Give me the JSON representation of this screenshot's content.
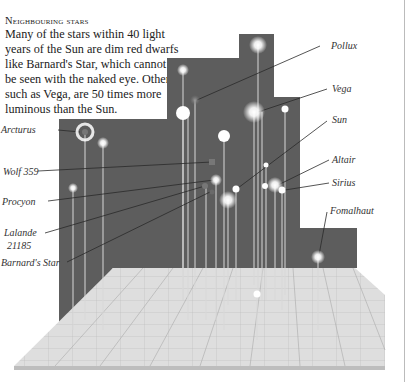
{
  "intro": {
    "title": "Neighbouring stars",
    "lines": [
      "Many of the stars within 40 light",
      "years of the Sun are dim red dwarfs",
      "like Barnard's Star, which cannot",
      "be seen with the naked eye. Others,",
      "such as Vega, are 50 times more",
      "luminous than the Sun."
    ]
  },
  "labels": {
    "left": [
      {
        "id": "arcturus",
        "text": "Arcturus"
      },
      {
        "id": "wolf359",
        "text": "Wolf 359"
      },
      {
        "id": "procyon",
        "text": "Procyon"
      },
      {
        "id": "lalande1",
        "text": "Lalande"
      },
      {
        "id": "lalande2",
        "text": "21185"
      },
      {
        "id": "barnard",
        "text": "Barnard's Star"
      }
    ],
    "right": [
      {
        "id": "pollux",
        "text": "Pollux"
      },
      {
        "id": "vega",
        "text": "Vega"
      },
      {
        "id": "sun",
        "text": "Sun"
      },
      {
        "id": "altair",
        "text": "Altair"
      },
      {
        "id": "sirius",
        "text": "Sirius"
      },
      {
        "id": "fomalhaut",
        "text": "Fomalhaut"
      }
    ]
  },
  "colors": {
    "panel": "#5d5d5d",
    "floor": "#dcdcdc",
    "star": "#ffffff",
    "leader": "#333333"
  }
}
